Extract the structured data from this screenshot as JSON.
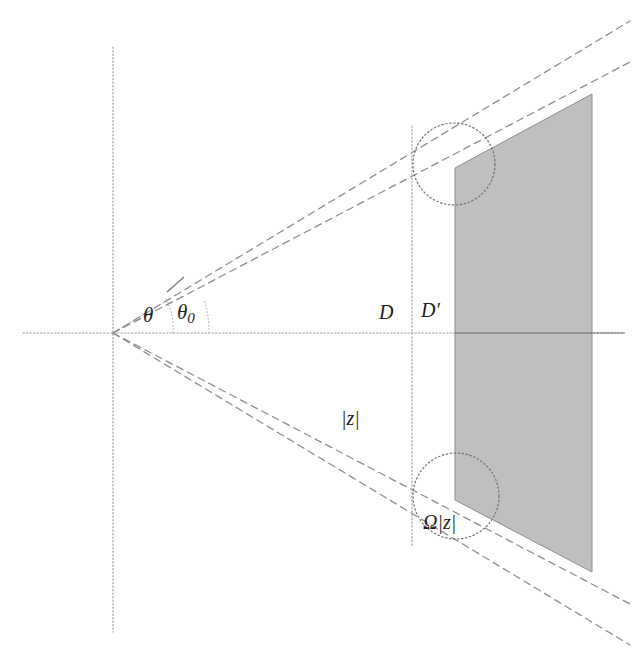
{
  "figure": {
    "kind": "geometric-diagram",
    "background_color": "#ffffff",
    "width": 643,
    "height": 669
  },
  "labels": {
    "theta": "θ",
    "theta_zero_base": "θ",
    "theta_zero_sub": "0",
    "distance_D": "D",
    "distance_Dprime_base": "D",
    "distance_Dprime_mark": "′",
    "modulus_z": "|z|",
    "omega_modulus_z": "Ω|z|"
  },
  "colors": {
    "axis_dotted": "#9a9a9a",
    "axis_solid": "#707070",
    "dashed_ray": "#8a8a8a",
    "circle_outline": "#6e6e6e",
    "shaded_fill": "#b9b9b9",
    "shaded_edge": "#8d8d8d",
    "text": "#1d1d1d"
  },
  "geometry": {
    "origin": {
      "x": 113,
      "y": 333
    },
    "axes": {
      "horizontal": {
        "x1": 23,
        "y1": 333,
        "x2": 625,
        "y2": 333
      },
      "vertical": {
        "x1": 113,
        "y1": 47,
        "x2": 113,
        "y2": 632
      }
    },
    "rays": [
      {
        "name": "upper-outer-theta",
        "x2": 628,
        "y2": 22
      },
      {
        "name": "upper-inner-theta0",
        "x2": 628,
        "y2": 63
      },
      {
        "name": "lower-inner-theta0",
        "x2": 628,
        "y2": 603
      },
      {
        "name": "lower-outer-theta",
        "x2": 628,
        "y2": 644
      }
    ],
    "vertical_D_line": {
      "x": 412,
      "y1": 128,
      "y2": 545
    },
    "shaded_region": {
      "left_x": 455,
      "right_x": 592,
      "top_left_y": 168,
      "top_right_y": 94,
      "bottom_left_y": 500,
      "bottom_right_y": 572
    },
    "circles": [
      {
        "name": "upper-circle",
        "cx": 454,
        "cy": 164,
        "r": 41
      },
      {
        "name": "lower-circle",
        "cx": 456,
        "cy": 496,
        "r": 43
      }
    ],
    "angle_arcs": [
      {
        "name": "theta-arc",
        "radius": 60
      },
      {
        "name": "theta0-arc",
        "radius": 96
      }
    ],
    "tick_mark": {
      "x1": 168,
      "y1": 291,
      "x2": 183,
      "y2": 276
    }
  }
}
